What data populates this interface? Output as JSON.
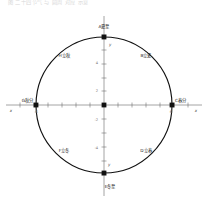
{
  "figure": {
    "caption": "图 二十四节气 与 圆周 对应 示意",
    "type": "unit-circle-diagram"
  },
  "axes": {
    "x_axis_label": "x",
    "y_axis_label": "y",
    "x_ticks": [
      "-6",
      "6"
    ],
    "y_ticks": [
      "4",
      "2",
      "-2",
      "-4"
    ],
    "y_top_label": "y",
    "y_bottom_label": "y",
    "origin_label": "O",
    "grid": false
  },
  "circle": {
    "center": [
      0,
      0
    ],
    "radius": 6,
    "stroke": "#111111",
    "fill": "none"
  },
  "points": [
    {
      "id": "A",
      "label": "A夏至",
      "term": "夏至",
      "angle_deg": 90,
      "x": 0,
      "y": 6,
      "marker": "square"
    },
    {
      "id": "B",
      "label": "B立夏",
      "term": "立夏",
      "angle_deg": 45,
      "x": 4.24,
      "y": 4.24,
      "marker": "none"
    },
    {
      "id": "C",
      "label": "C春分",
      "term": "春分",
      "angle_deg": 0,
      "x": 6,
      "y": 0,
      "marker": "square"
    },
    {
      "id": "D",
      "label": "D立春",
      "term": "立春",
      "angle_deg": 315,
      "x": 4.24,
      "y": -4.24,
      "marker": "none"
    },
    {
      "id": "E",
      "label": "E冬至",
      "term": "冬至",
      "angle_deg": 270,
      "x": 0,
      "y": -6,
      "marker": "square"
    },
    {
      "id": "F",
      "label": "F立冬",
      "term": "立冬",
      "angle_deg": 225,
      "x": -4.24,
      "y": -4.24,
      "marker": "none"
    },
    {
      "id": "G",
      "label": "G秋分",
      "term": "秋分",
      "angle_deg": 180,
      "x": -6,
      "y": 0,
      "marker": "square"
    },
    {
      "id": "H",
      "label": "H立秋",
      "term": "立秋",
      "angle_deg": 135,
      "x": -4.24,
      "y": 4.24,
      "marker": "none"
    }
  ],
  "colors": {
    "stroke": "#111111",
    "axis": "#5a5a5a",
    "text": "#1f1f1f",
    "tick_text": "#707070",
    "background": "#ffffff"
  }
}
